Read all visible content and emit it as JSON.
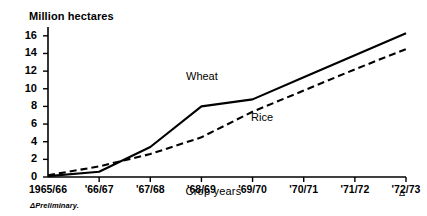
{
  "chart_data": {
    "type": "line",
    "title": "",
    "ylabel": "Million hectares",
    "xlabel": "Crop years",
    "categories": [
      "1965/66",
      "'66/67",
      "'67/68",
      "'68/69",
      "'69/70",
      "'70/71",
      "'71/72",
      "'72/73"
    ],
    "ylim": [
      0,
      17
    ],
    "yticks": [
      0,
      2,
      4,
      6,
      8,
      10,
      12,
      14,
      16
    ],
    "ytick_labels": [
      "0",
      "2",
      "4",
      "6",
      "8",
      "10",
      "12",
      "14",
      "16"
    ],
    "grid": false,
    "legend_position": "inline-annotation",
    "series": [
      {
        "name": "Wheat",
        "style": "solid",
        "color": "#000000",
        "values": [
          0.1,
          0.6,
          3.4,
          8.0,
          8.8,
          11.3,
          13.8,
          16.3
        ]
      },
      {
        "name": "Rice",
        "style": "dashed",
        "color": "#000000",
        "values": [
          0.2,
          1.2,
          2.6,
          4.5,
          7.4,
          9.8,
          12.2,
          14.5
        ]
      }
    ],
    "annotations": [
      {
        "text": "Wheat",
        "series": "Wheat"
      },
      {
        "text": "Rice",
        "series": "Rice"
      }
    ],
    "footnote_marker": "Δ",
    "footnote": "ΔPreliminary.",
    "axis_marker": "Δ"
  }
}
